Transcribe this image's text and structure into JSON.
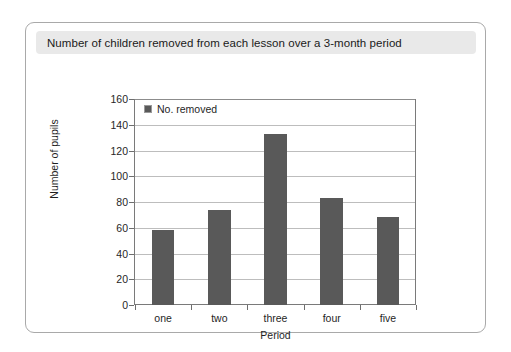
{
  "figure": {
    "title": "Number of children removed from each lesson over a 3-month period"
  },
  "colors": {
    "bar": "#595959",
    "title_bar_background": "#e9e9e9",
    "frame_border": "#a9a9a9",
    "gridline": "#bdbdbd",
    "axis": "#7a7a7a"
  },
  "chart_data": {
    "type": "bar",
    "title": "Number of children removed from each lesson over a 3-month period",
    "categories": [
      "one",
      "two",
      "three",
      "four",
      "five"
    ],
    "values": [
      58,
      74,
      133,
      83,
      68
    ],
    "series": [
      {
        "name": "No. removed",
        "values": [
          58,
          74,
          133,
          83,
          68
        ]
      }
    ],
    "xlabel": "Period",
    "ylabel": "Number of pupils",
    "ylim": [
      0,
      160
    ],
    "ytick_step": 20,
    "yticks": [
      0,
      20,
      40,
      60,
      80,
      100,
      120,
      140,
      160
    ],
    "ytick_labels": [
      "0",
      "20",
      "40",
      "60",
      "80",
      "100",
      "120",
      "140",
      "160"
    ],
    "grid": true,
    "grid_axis": "y",
    "legend": {
      "entries": [
        "No. removed"
      ],
      "position": "top-left-inside"
    }
  }
}
